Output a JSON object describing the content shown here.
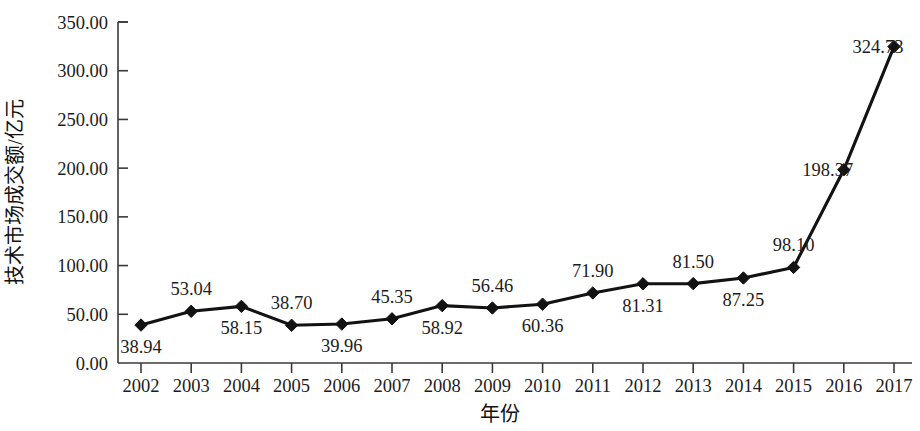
{
  "chart_data": {
    "type": "line",
    "title": "",
    "xlabel": "年份",
    "ylabel": "技术市场成交额/亿元",
    "categories": [
      "2002",
      "2003",
      "2004",
      "2005",
      "2006",
      "2007",
      "2008",
      "2009",
      "2010",
      "2011",
      "2012",
      "2013",
      "2014",
      "2015",
      "2016",
      "2017"
    ],
    "values": [
      38.94,
      53.04,
      58.15,
      38.7,
      39.96,
      45.35,
      58.92,
      56.46,
      60.36,
      71.9,
      81.31,
      81.5,
      87.25,
      98.1,
      198.37,
      324.73
    ],
    "point_labels": [
      "38.94",
      "53.04",
      "58.15",
      "38.70",
      "39.96",
      "45.35",
      "58.92",
      "56.46",
      "60.36",
      "71.90",
      "81.31",
      "81.50",
      "87.25",
      "98.10",
      "198.37",
      "324.73"
    ],
    "label_positions": [
      "below",
      "above",
      "below",
      "above",
      "below",
      "above",
      "below",
      "above",
      "below",
      "above",
      "below",
      "above",
      "below",
      "above",
      "left",
      "left"
    ],
    "ylim": [
      0,
      350
    ],
    "ytick_values": [
      0,
      50,
      100,
      150,
      200,
      250,
      300,
      350
    ],
    "ytick_labels": [
      "0.00",
      "50.00",
      "100.00",
      "150.00",
      "200.00",
      "250.00",
      "300.00",
      "350.00"
    ],
    "grid": false,
    "legend": "none",
    "series": [
      {
        "name": "技术市场成交额",
        "marker": "diamond",
        "color": "#121212",
        "values": [
          38.94,
          53.04,
          58.15,
          38.7,
          39.96,
          45.35,
          58.92,
          56.46,
          60.36,
          71.9,
          81.31,
          81.5,
          87.25,
          98.1,
          198.37,
          324.73
        ]
      }
    ]
  },
  "axes": {
    "y_title": "技术市场成交额/亿元",
    "x_title": "年份"
  }
}
